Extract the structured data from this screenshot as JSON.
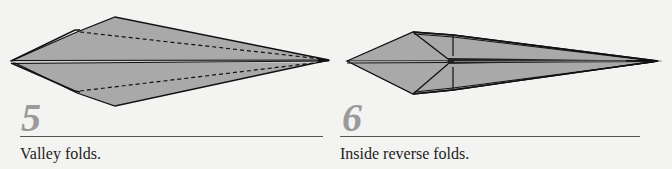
{
  "steps": [
    {
      "number": "5",
      "caption": "Valley folds."
    },
    {
      "number": "6",
      "caption": "Inside reverse folds."
    }
  ],
  "colors": {
    "paper_fill": "#a9a9a9",
    "line": "#111111",
    "number": "#9a9a9a",
    "background": "#f3f3f1"
  }
}
